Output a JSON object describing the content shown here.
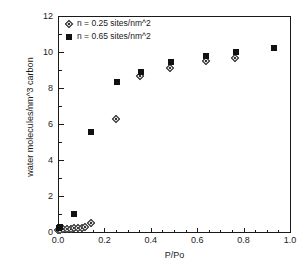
{
  "chart_data": {
    "type": "scatter",
    "title": "",
    "xlabel": "P/Po",
    "ylabel": "water molecules/nm^3 carbon",
    "xlim": [
      0.0,
      1.0
    ],
    "ylim": [
      0,
      12
    ],
    "xticks": [
      "0.0",
      "0.2",
      "0.4",
      "0.6",
      "0.8",
      "1.0"
    ],
    "xtick_values": [
      0.0,
      0.2,
      0.4,
      0.6,
      0.8,
      1.0
    ],
    "yticks": [
      "0",
      "2",
      "4",
      "6",
      "8",
      "10",
      "12"
    ],
    "ytick_values": [
      0,
      2,
      4,
      6,
      8,
      10,
      12
    ],
    "grid": false,
    "legend_position": "top-left",
    "series": [
      {
        "name": "n = 0.25 sites/nm^2",
        "marker": "open-diamond",
        "color": "#111111",
        "points": [
          {
            "x": 0.004,
            "y": 0.08
          },
          {
            "x": 0.012,
            "y": 0.1
          },
          {
            "x": 0.022,
            "y": 0.12
          },
          {
            "x": 0.04,
            "y": 0.14
          },
          {
            "x": 0.057,
            "y": 0.16
          },
          {
            "x": 0.072,
            "y": 0.18
          },
          {
            "x": 0.09,
            "y": 0.2
          },
          {
            "x": 0.105,
            "y": 0.22
          },
          {
            "x": 0.12,
            "y": 0.25
          },
          {
            "x": 0.143,
            "y": 0.45
          },
          {
            "x": 0.253,
            "y": 6.25
          },
          {
            "x": 0.357,
            "y": 8.62
          },
          {
            "x": 0.487,
            "y": 9.1
          },
          {
            "x": 0.638,
            "y": 9.45
          },
          {
            "x": 0.767,
            "y": 9.65
          }
        ]
      },
      {
        "name": "n = 0.65 sites/nm^2",
        "marker": "filled-square",
        "color": "#111111",
        "points": [
          {
            "x": 0.004,
            "y": 0.2
          },
          {
            "x": 0.01,
            "y": 0.28
          },
          {
            "x": 0.07,
            "y": 1.0
          },
          {
            "x": 0.143,
            "y": 5.55
          },
          {
            "x": 0.253,
            "y": 8.35
          },
          {
            "x": 0.357,
            "y": 8.88
          },
          {
            "x": 0.487,
            "y": 9.47
          },
          {
            "x": 0.638,
            "y": 9.78
          },
          {
            "x": 0.767,
            "y": 10.0
          },
          {
            "x": 0.93,
            "y": 10.2
          }
        ]
      }
    ]
  }
}
